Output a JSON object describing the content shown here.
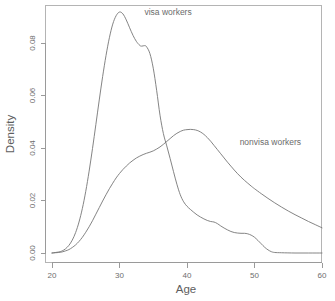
{
  "chart_data": {
    "type": "line",
    "title": "",
    "subtitle": "",
    "xlabel": "Age",
    "ylabel": "Density",
    "xlim": [
      20,
      60
    ],
    "ylim": [
      0.0,
      0.0935
    ],
    "grid": false,
    "legend_position": "inline-annotations",
    "x_ticks": [
      20,
      30,
      40,
      50,
      60
    ],
    "x_tick_labels": [
      "20",
      "30",
      "40",
      "50",
      "60"
    ],
    "y_ticks": [
      0.0,
      0.02,
      0.04,
      0.06,
      0.08
    ],
    "y_tick_labels": [
      "0.00",
      "0.02",
      "0.04",
      "0.06",
      "0.08"
    ],
    "annotations": [
      {
        "text": "visa workers",
        "x": 33.7,
        "y": 0.0905
      },
      {
        "text": "nonvisa workers",
        "x": 47.8,
        "y": 0.0412
      }
    ],
    "series": [
      {
        "name": "visa workers",
        "label": "visa workers",
        "color": "#767676",
        "x": [
          20,
          21,
          21.5,
          22,
          22.5,
          23,
          23.5,
          24,
          24.5,
          25,
          25.5,
          26,
          26.5,
          27,
          27.5,
          28,
          28.5,
          29,
          29.5,
          30,
          30.5,
          31,
          31.5,
          32,
          32.5,
          33,
          33.3,
          33.7,
          34,
          34.5,
          35,
          35.5,
          36,
          36.5,
          37,
          37.5,
          38,
          38.5,
          39,
          39.5,
          40,
          40.5,
          41,
          41.5,
          42,
          42.5,
          43,
          43.5,
          44,
          44.5,
          45,
          45.5,
          46,
          46.5,
          47,
          47.5,
          48,
          48.5,
          49,
          49.5,
          50,
          50.5,
          51,
          51.5,
          52,
          52.5,
          53,
          54,
          56,
          58,
          60
        ],
        "y": [
          0.0,
          0.0004,
          0.0008,
          0.0016,
          0.0029,
          0.0049,
          0.0078,
          0.0118,
          0.017,
          0.0235,
          0.0312,
          0.0398,
          0.049,
          0.0583,
          0.0672,
          0.0752,
          0.082,
          0.0872,
          0.0904,
          0.0918,
          0.0911,
          0.0888,
          0.0858,
          0.0829,
          0.0806,
          0.0791,
          0.0788,
          0.079,
          0.0786,
          0.076,
          0.0704,
          0.062,
          0.0525,
          0.0455,
          0.0408,
          0.036,
          0.031,
          0.0262,
          0.0222,
          0.0195,
          0.0178,
          0.0166,
          0.0155,
          0.0145,
          0.0137,
          0.013,
          0.0124,
          0.012,
          0.0118,
          0.0112,
          0.0103,
          0.0095,
          0.0088,
          0.0082,
          0.0078,
          0.0076,
          0.0075,
          0.0075,
          0.0073,
          0.0068,
          0.006,
          0.0048,
          0.0035,
          0.0022,
          0.0012,
          0.0005,
          0.0002,
          0.0001,
          0.0,
          0.0,
          0.0
        ]
      },
      {
        "name": "nonvisa workers",
        "label": "nonvisa workers",
        "color": "#767676",
        "x": [
          20,
          20.5,
          21,
          21.5,
          22,
          22.5,
          23,
          23.5,
          24,
          24.5,
          25,
          25.5,
          26,
          26.5,
          27,
          27.5,
          28,
          28.5,
          29,
          29.5,
          30,
          30.5,
          31,
          31.5,
          32,
          32.5,
          33,
          33.5,
          34,
          34.5,
          35,
          35.5,
          36,
          36.5,
          37,
          37.5,
          38,
          38.5,
          39,
          39.5,
          40,
          40.5,
          41,
          41.5,
          42,
          42.5,
          43,
          43.5,
          44,
          44.5,
          45,
          45.5,
          46,
          46.5,
          47,
          47.5,
          48,
          48.5,
          49,
          49.5,
          50,
          51,
          52,
          53,
          54,
          55,
          56,
          57,
          58,
          59,
          60
        ],
        "y": [
          0.0,
          0.0001,
          0.0002,
          0.0004,
          0.0008,
          0.0013,
          0.0021,
          0.0031,
          0.0044,
          0.006,
          0.0079,
          0.01,
          0.0123,
          0.0148,
          0.0173,
          0.0198,
          0.0222,
          0.0245,
          0.0266,
          0.0286,
          0.0303,
          0.0318,
          0.0331,
          0.0343,
          0.0353,
          0.0362,
          0.0369,
          0.0375,
          0.038,
          0.0384,
          0.0389,
          0.0396,
          0.0404,
          0.0414,
          0.0425,
          0.0436,
          0.0447,
          0.0456,
          0.0463,
          0.0468,
          0.047,
          0.0471,
          0.047,
          0.0467,
          0.0461,
          0.0452,
          0.044,
          0.0426,
          0.041,
          0.0394,
          0.0378,
          0.0362,
          0.0346,
          0.0331,
          0.0316,
          0.0302,
          0.0289,
          0.0277,
          0.0266,
          0.0255,
          0.0245,
          0.0226,
          0.0208,
          0.0191,
          0.0175,
          0.016,
          0.0146,
          0.0133,
          0.012,
          0.0108,
          0.0096
        ]
      }
    ]
  },
  "figure": {
    "background": "#ffffff",
    "axis_color": "#9a9a9a",
    "curve_color": "#767676",
    "text_color": "#6b6b6b"
  }
}
